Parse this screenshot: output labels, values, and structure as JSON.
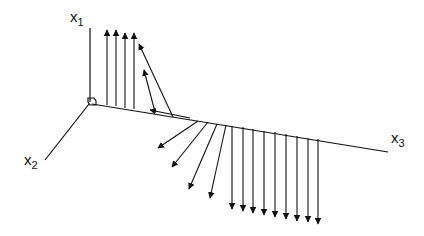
{
  "diagram": {
    "type": "3d-vector-field-along-axis",
    "axes": [
      {
        "name": "x1",
        "base": "x",
        "subscript": "1"
      },
      {
        "name": "x2",
        "base": "x",
        "subscript": "2"
      },
      {
        "name": "x3",
        "base": "x",
        "subscript": "3"
      }
    ],
    "stroke_color": "#111111",
    "background": "#ffffff",
    "vectors": {
      "up_count": 4,
      "tilted_up_count": 2,
      "diagonal_down_count": 4,
      "vertical_down_count": 9
    }
  }
}
